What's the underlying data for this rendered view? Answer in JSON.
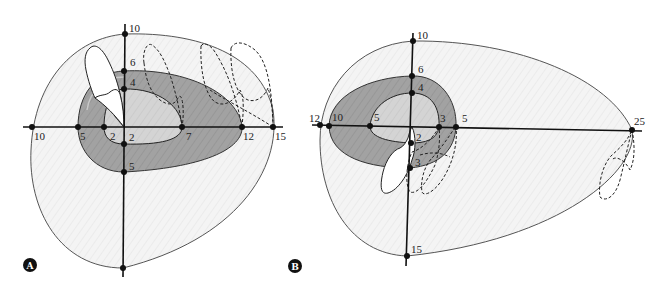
{
  "figure": {
    "colors": {
      "outer_field": "#f3f3f3",
      "middle_field": "#9e9e9e",
      "inner_field": "#d2d2d2",
      "tooth": "#ffffff",
      "line": "#111111",
      "outline": "#555555"
    },
    "panels": [
      {
        "id": "A",
        "letter": "A",
        "axis_labels": {
          "top_outer": "10",
          "top_middle": "6",
          "top_inner": "4",
          "bottom_inner": "2",
          "bottom_middle": "5",
          "left_outer": "10",
          "left_middle": "5",
          "left_inner": "2",
          "right_inner": "7",
          "right_middle": "12",
          "right_outer": "15"
        }
      },
      {
        "id": "B",
        "letter": "B",
        "axis_labels": {
          "top_outer": "10",
          "top_middle": "6",
          "top_inner": "4",
          "bottom_inner": "2",
          "bottom_middle": "3",
          "bottom_outer": "15",
          "left_outer": "12",
          "left_middle": "10",
          "left_inner": "5",
          "right_inner": "3",
          "right_middle": "5",
          "right_outer": "25"
        }
      }
    ]
  }
}
